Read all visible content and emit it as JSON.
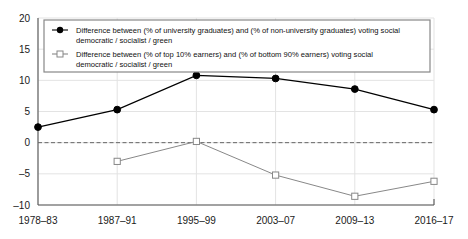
{
  "chart_data": {
    "type": "line",
    "title": "",
    "subtitle": "",
    "xlabel": "",
    "ylabel": "",
    "categories": [
      "1978–83",
      "1987–91",
      "1995–99",
      "2003–07",
      "2009–13",
      "2016–17"
    ],
    "ylim": [
      -10,
      20
    ],
    "yticks": [
      -10,
      -5,
      0,
      5,
      10,
      15,
      20
    ],
    "ytick_labels": [
      "–10",
      "–5",
      "0",
      "5",
      "10",
      "15",
      "20"
    ],
    "grid": true,
    "zero_line": true,
    "legend_position": "top-left-inside",
    "series": [
      {
        "name": "Difference between (% of university graduates) and (% of non-university graduates) voting social democratic / socialist / green",
        "marker": "filled-circle",
        "color": "#000000",
        "values": [
          2.5,
          5.3,
          10.8,
          10.3,
          8.6,
          5.3
        ],
        "x": [
          "1978–83",
          "1987–91",
          "1995–99",
          "2003–07",
          "2009–13",
          "2016–17"
        ]
      },
      {
        "name": "Difference between (% of top 10% earners) and (% of bottom 90% earners) voting social democratic / socialist / green",
        "marker": "open-square",
        "color": "#888888",
        "values": [
          null,
          -3.0,
          0.2,
          -5.2,
          -8.6,
          -6.2
        ],
        "x": [
          "1978–83",
          "1987–91",
          "1995–99",
          "2003–07",
          "2009–13",
          "2016–17"
        ]
      }
    ]
  },
  "legend": {
    "entries": [
      {
        "marker_name": "filled-circle-marker",
        "line1": "Difference between (% of university graduates) and (% of non-university graduates) voting social",
        "line2": "democratic / socialist / green"
      },
      {
        "marker_name": "open-square-marker",
        "line1": "Difference between (% of top 10% earners) and (% of bottom 90% earners) voting social",
        "line2": "democratic / socialist / green"
      }
    ]
  },
  "axes": {
    "y_tick_labels": [
      "20",
      "15",
      "10",
      "5",
      "0",
      "–5",
      "–10"
    ],
    "x_tick_labels": [
      "1978–83",
      "1987–91",
      "1995–99",
      "2003–07",
      "2009–13",
      "2016–17"
    ]
  },
  "colors": {
    "series1": "#000000",
    "series2": "#8c8c8c",
    "axis": "#555555",
    "grid": "#e3e3e3",
    "text": "#1a1a1a"
  }
}
